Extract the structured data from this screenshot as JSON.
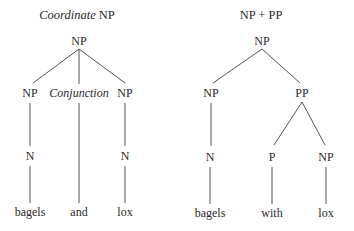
{
  "trees": [
    {
      "title_italic": "Coordinate",
      "title_rest": " NP",
      "nodes": {
        "root": "NP",
        "left_np": "NP",
        "conjunction": "Conjunction",
        "right_np": "NP",
        "left_n": "N",
        "right_n": "N",
        "leaf_1": "bagels",
        "leaf_2": "and",
        "leaf_3": "lox"
      }
    },
    {
      "title": "NP + PP",
      "nodes": {
        "root": "NP",
        "np": "NP",
        "pp": "PP",
        "n": "N",
        "p": "P",
        "pp_np": "NP",
        "leaf_1": "bagels",
        "leaf_2": "with",
        "leaf_3": "lox"
      }
    }
  ]
}
